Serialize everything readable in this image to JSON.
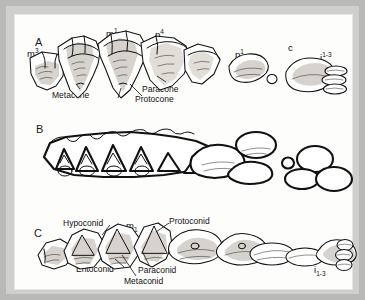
{
  "figure": {
    "background_color": "#b9b9b7",
    "plate_color": "#fdfdfc",
    "ink_color": "#111111",
    "shade_color": "#cfcac4"
  },
  "panels": [
    {
      "letter": "A",
      "view": "upper dentition, labial view",
      "tooth_labels": [
        {
          "id": "m3",
          "base": "m",
          "script": "3",
          "script_type": "super"
        },
        {
          "id": "m1",
          "base": "m",
          "script": "1",
          "script_type": "super"
        },
        {
          "id": "p4",
          "base": "p",
          "script": "4",
          "script_type": "super"
        },
        {
          "id": "p1",
          "base": "p",
          "script": "1",
          "script_type": "super"
        },
        {
          "id": "c",
          "base": "c",
          "script": "",
          "script_type": "none"
        },
        {
          "id": "i1-3",
          "base": "i",
          "script": "1-3",
          "script_type": "super"
        }
      ],
      "cusp_labels": [
        "Metacone",
        "Paracone",
        "Protocone"
      ]
    },
    {
      "letter": "B",
      "view": "upper dentition, occlusal view",
      "tooth_labels": [],
      "cusp_labels": []
    },
    {
      "letter": "C",
      "view": "lower dentition, lingual view",
      "tooth_labels": [
        {
          "id": "m3",
          "base": "m",
          "script": "3",
          "script_type": "sub"
        },
        {
          "id": "m1",
          "base": "m",
          "script": "1",
          "script_type": "sub"
        },
        {
          "id": "p4",
          "base": "p",
          "script": "4",
          "script_type": "sub"
        },
        {
          "id": "p1",
          "base": "p",
          "script": "1",
          "script_type": "sub"
        },
        {
          "id": "i1-3",
          "base": "i",
          "script": "1-3",
          "script_type": "sub"
        }
      ],
      "cusp_labels": [
        "Hypoconid",
        "Protoconid",
        "Entoconid",
        "Paraconid",
        "Metaconid"
      ]
    }
  ]
}
